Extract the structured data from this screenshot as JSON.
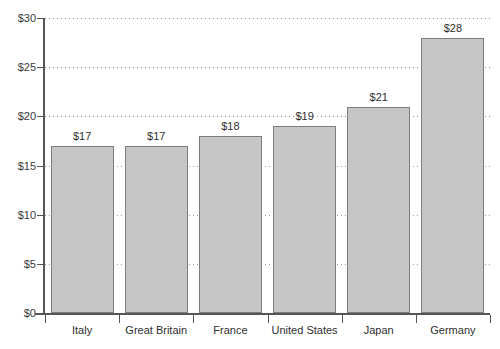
{
  "chart_data": {
    "type": "bar",
    "title": "",
    "xlabel": "",
    "ylabel": "",
    "categories": [
      "Italy",
      "Great Britain",
      "France",
      "United States",
      "Japan",
      "Germany"
    ],
    "values": [
      17,
      17,
      18,
      19,
      21,
      28
    ],
    "value_labels": [
      "$17",
      "$17",
      "$18",
      "$19",
      "$21",
      "$28"
    ],
    "ylim": [
      0,
      30
    ],
    "ytick_values": [
      30,
      25,
      20,
      15,
      10,
      5,
      0
    ],
    "ytick_labels": [
      "$30",
      "$25",
      "$20",
      "$15",
      "$10",
      "$5",
      "$0"
    ],
    "grid": true,
    "grid_axis": "y",
    "grid_style": "dotted",
    "legend": "none",
    "bar_fill_color": "#c6c6c6",
    "bar_border_color": "#7d7d7d",
    "axis_color": "#555555",
    "gridline_color": "#8d8d8d",
    "text_color": "#2e2e2e"
  }
}
